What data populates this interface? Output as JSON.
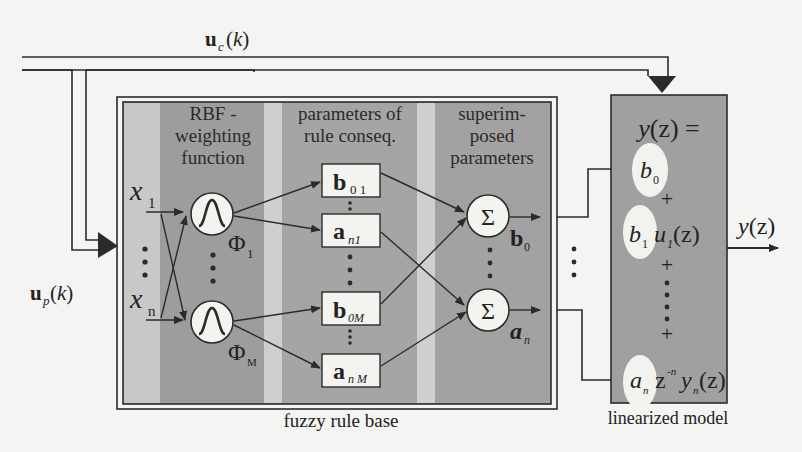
{
  "signals": {
    "uc": {
      "main": "u",
      "sub": "c",
      "arg": "(k)"
    },
    "up": {
      "main": "u",
      "sub": "p",
      "arg": "(k)"
    },
    "y_out": "y(z)"
  },
  "fuzzy_rule_base": {
    "label": "fuzzy rule base",
    "columns": [
      {
        "header_lines": [
          "RBF -",
          "weighting",
          "function"
        ]
      },
      {
        "header_lines": [
          "parameters of",
          "rule conseq."
        ]
      },
      {
        "header_lines": [
          "superim-",
          "posed",
          "parameters"
        ]
      }
    ],
    "inputs": [
      {
        "main": "x",
        "sub": "1"
      },
      {
        "main": "x",
        "sub": "n"
      }
    ],
    "rbf_nodes": [
      {
        "label": "Φ",
        "sub": "1"
      },
      {
        "label": "Φ",
        "sub": "M"
      }
    ],
    "param_boxes": [
      {
        "main": "b",
        "sub": "0 1"
      },
      {
        "main": "a",
        "sub": "n1"
      },
      {
        "main": "b",
        "sub": "0M"
      },
      {
        "main": "a",
        "sub": "n M"
      }
    ],
    "sum_nodes": [
      {
        "symbol": "Σ",
        "out_main": "b",
        "out_sub": "0"
      },
      {
        "symbol": "Σ",
        "out_main": "a",
        "out_sub": "n"
      }
    ]
  },
  "linearized_model": {
    "label": "linearized model",
    "equation_head": "y(z) =",
    "terms": [
      {
        "coef": "b",
        "coef_sub": "0",
        "rest": ""
      },
      {
        "coef": "b",
        "coef_sub": "1",
        "rest": "u",
        "rest_sub": "1",
        "rest_arg": "(z)"
      },
      {
        "coef": "a",
        "coef_sub": "n",
        "rest": "z",
        "rest_sup": "-n",
        "rest2": "y",
        "rest2_sub": "n",
        "rest2_arg": "(z)"
      }
    ],
    "plus": "+"
  },
  "colors": {
    "panel_dark": "#9e9e9e",
    "panel_light": "#c9c9c9",
    "node_fill": "#f3f3f0",
    "ellipse_fill": "#f2f2ee",
    "line": "#2b2b2b",
    "background": "#f4f4f2"
  }
}
